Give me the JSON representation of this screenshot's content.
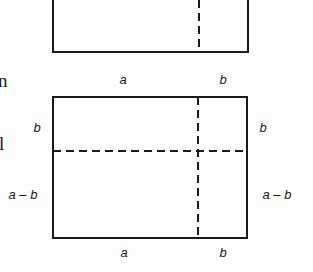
{
  "diagram": {
    "top_rectangle": {
      "partial": true
    },
    "bottom_rectangle": {
      "top_labels": [
        "a",
        "b"
      ],
      "bottom_labels": [
        "a",
        "b"
      ],
      "left_labels": [
        "b",
        "a - b"
      ],
      "right_labels": [
        "b",
        "a - b"
      ]
    },
    "margin_fragments": [
      "n",
      "l"
    ],
    "colors": {
      "line": "#1a1a1a",
      "background": "#fdfdfd"
    }
  }
}
